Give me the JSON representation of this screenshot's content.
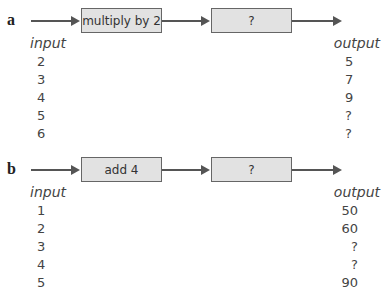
{
  "parts": [
    {
      "label": "a",
      "machines": [
        "multiply by 2",
        "?"
      ],
      "input_header": "input",
      "output_header": "output",
      "inputs": [
        "2",
        "3",
        "4",
        "5",
        "6"
      ],
      "outputs": [
        "5",
        "7",
        "9",
        "?",
        "?"
      ]
    },
    {
      "label": "b",
      "machines": [
        "add 4",
        "?"
      ],
      "input_header": "input",
      "output_header": "output",
      "inputs": [
        "1",
        "2",
        "3",
        "4",
        "5"
      ],
      "outputs": [
        "50",
        "60",
        "?",
        "?",
        "90"
      ]
    }
  ]
}
